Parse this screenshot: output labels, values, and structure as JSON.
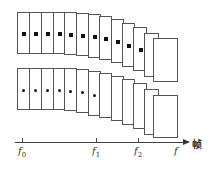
{
  "diagram": {
    "rows": [
      {
        "name": "top-row",
        "marker": "square",
        "frames": [
          {
            "x": 17,
            "y": 12,
            "w": 12,
            "h": 42,
            "marker": true
          },
          {
            "x": 29,
            "y": 12,
            "w": 12,
            "h": 42,
            "marker": true
          },
          {
            "x": 41,
            "y": 12,
            "w": 12,
            "h": 42,
            "marker": true
          },
          {
            "x": 53,
            "y": 12,
            "w": 12,
            "h": 42,
            "marker": true
          },
          {
            "x": 64,
            "y": 12,
            "w": 12,
            "h": 43,
            "marker": true
          },
          {
            "x": 76,
            "y": 13,
            "w": 12,
            "h": 43,
            "marker": true
          },
          {
            "x": 88,
            "y": 14,
            "w": 12,
            "h": 44,
            "marker": true
          },
          {
            "x": 99,
            "y": 16,
            "w": 12,
            "h": 44,
            "marker": true
          },
          {
            "x": 111,
            "y": 19,
            "w": 12,
            "h": 44,
            "marker": true
          },
          {
            "x": 122,
            "y": 23,
            "w": 12,
            "h": 44,
            "marker": true
          },
          {
            "x": 133,
            "y": 27,
            "w": 13,
            "h": 44,
            "marker": true
          },
          {
            "x": 144,
            "y": 33,
            "w": 14,
            "h": 44,
            "marker": false
          },
          {
            "x": 153,
            "y": 38,
            "w": 24,
            "h": 44,
            "marker": false
          }
        ]
      },
      {
        "name": "bottom-row",
        "marker": "dot",
        "frames": [
          {
            "x": 17,
            "y": 68,
            "w": 12,
            "h": 42,
            "marker": true
          },
          {
            "x": 29,
            "y": 68,
            "w": 12,
            "h": 42,
            "marker": true
          },
          {
            "x": 41,
            "y": 68,
            "w": 12,
            "h": 42,
            "marker": true
          },
          {
            "x": 53,
            "y": 68,
            "w": 12,
            "h": 42,
            "marker": true
          },
          {
            "x": 64,
            "y": 68,
            "w": 12,
            "h": 43,
            "marker": true
          },
          {
            "x": 76,
            "y": 69,
            "w": 12,
            "h": 44,
            "marker": true
          },
          {
            "x": 88,
            "y": 71,
            "w": 12,
            "h": 45,
            "marker": true
          },
          {
            "x": 99,
            "y": 73,
            "w": 12,
            "h": 45,
            "marker": false
          },
          {
            "x": 111,
            "y": 76,
            "w": 12,
            "h": 45,
            "marker": false
          },
          {
            "x": 122,
            "y": 79,
            "w": 12,
            "h": 46,
            "marker": false
          },
          {
            "x": 133,
            "y": 83,
            "w": 13,
            "h": 46,
            "marker": false
          },
          {
            "x": 144,
            "y": 89,
            "w": 14,
            "h": 46,
            "marker": false
          },
          {
            "x": 153,
            "y": 95,
            "w": 24,
            "h": 43,
            "marker": false
          }
        ]
      }
    ],
    "axis": {
      "unit_label": "帧",
      "ticks": [
        {
          "x": 22,
          "base": "f",
          "sub": "0"
        },
        {
          "x": 96,
          "base": "f",
          "sub": "1"
        },
        {
          "x": 138,
          "base": "f",
          "sub": "2"
        },
        {
          "x": 178,
          "base": "f",
          "sub": ""
        }
      ]
    }
  }
}
